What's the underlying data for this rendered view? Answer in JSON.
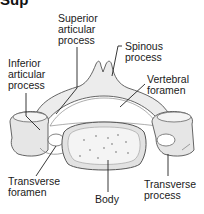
{
  "heading": "Sup",
  "diagram": {
    "labels": [
      {
        "id": "superior-articular-process",
        "lines": [
          "Superior",
          "articular",
          "process"
        ]
      },
      {
        "id": "spinous-process",
        "lines": [
          "Spinous",
          "process"
        ]
      },
      {
        "id": "inferior-articular-process",
        "lines": [
          "Inferior",
          "articular",
          "process"
        ]
      },
      {
        "id": "vertebral-foramen",
        "lines": [
          "Vertebral",
          "foramen"
        ]
      },
      {
        "id": "transverse-foramen",
        "lines": [
          "Transverse",
          "foramen"
        ]
      },
      {
        "id": "body",
        "lines": [
          "Body"
        ]
      },
      {
        "id": "transverse-process",
        "lines": [
          "Transverse",
          "process"
        ]
      }
    ]
  },
  "colors": {
    "bone_fill": "#ececec",
    "bone_shadow": "#b8b8b8",
    "outline": "#555555",
    "leader": "#222222",
    "text": "#1a1a1a",
    "body_fill": "#f2f2f2"
  }
}
